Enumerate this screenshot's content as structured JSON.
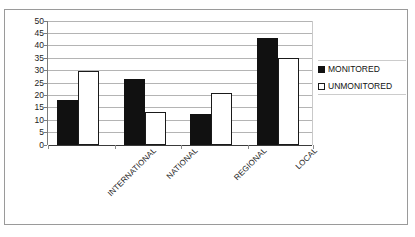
{
  "chart_data": {
    "type": "bar",
    "title": "",
    "subtitle": "",
    "xlabel": "",
    "ylabel": "",
    "categories": [
      "INTERNATIONAL",
      "NATIONAL",
      "REGIONAL",
      "LOCAL"
    ],
    "series": [
      {
        "name": "MONITORED",
        "color": "#111111",
        "values": [
          18,
          26.5,
          12.5,
          43
        ]
      },
      {
        "name": "UNMONITORED",
        "color": "#ffffff",
        "values": [
          30,
          13.5,
          21,
          35
        ]
      }
    ],
    "ylim": [
      0,
      50
    ],
    "yticks": [
      0,
      5,
      10,
      15,
      20,
      25,
      30,
      35,
      40,
      45,
      50
    ],
    "ytick_labels": [
      "0",
      "5",
      "10",
      "15",
      "20",
      "25",
      "30",
      "35",
      "40",
      "45",
      "50"
    ],
    "grid": true,
    "grid_axis": "y",
    "legend_position": "right",
    "xtick_label_rotation": -45
  },
  "legend": {
    "items": [
      {
        "label": "MONITORED",
        "swatch": "filled-square-icon"
      },
      {
        "label": "UNMONITORED",
        "swatch": "hollow-square-icon"
      }
    ]
  }
}
